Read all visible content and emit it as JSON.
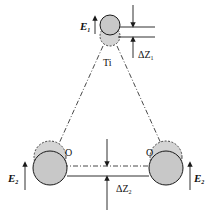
{
  "figure": {
    "type": "diagram",
    "colors": {
      "ball_fill": "#c8c8c8",
      "ball_ghost_fill": "#d4d4d4",
      "line": "#1a1a1a",
      "background": "#ffffff"
    },
    "labels": {
      "top_force": "E",
      "top_force_sub": "1",
      "top_disp": "ΔZ",
      "top_disp_sub": "1",
      "top_point": "Ti",
      "left_point": "O",
      "right_point": "O",
      "left_force": "E",
      "left_force_sub": "2",
      "right_force": "E",
      "right_force_sub": "2",
      "bottom_disp": "ΔZ",
      "bottom_disp_sub": "2"
    }
  }
}
